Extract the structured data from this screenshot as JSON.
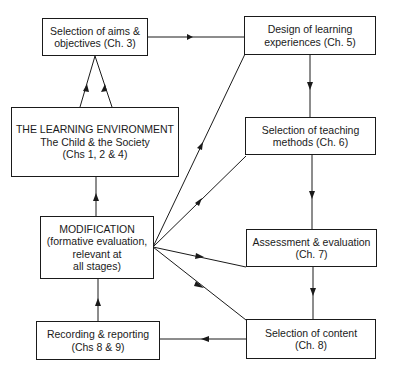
{
  "diagram": {
    "nodes": {
      "aims": {
        "lines": [
          "Selection of aims &",
          "objectives (Ch. 3)"
        ]
      },
      "environment": {
        "lines": [
          "THE LEARNING ENVIRONMENT",
          "The Child & the Society",
          "(Chs 1, 2 & 4)"
        ]
      },
      "modification": {
        "lines": [
          "MODIFICATION",
          "(formative evaluation,",
          "relevant at",
          "all stages)"
        ]
      },
      "recording": {
        "lines": [
          "Recording & reporting",
          "(Chs 8 & 9)"
        ]
      },
      "design": {
        "lines": [
          "Design of learning",
          "experiences (Ch. 5)"
        ]
      },
      "methods": {
        "lines": [
          "Selection of teaching",
          "methods (Ch. 6)"
        ]
      },
      "assessment": {
        "lines": [
          "Assessment & evaluation",
          "(Ch. 7)"
        ]
      },
      "content": {
        "lines": [
          "Selection of content",
          "(Ch. 8)"
        ]
      }
    },
    "edges": [
      {
        "from": "aims",
        "to": "design"
      },
      {
        "from": "design",
        "to": "methods"
      },
      {
        "from": "methods",
        "to": "assessment"
      },
      {
        "from": "assessment",
        "to": "content"
      },
      {
        "from": "content",
        "to": "recording"
      },
      {
        "from": "recording",
        "to": "modification"
      },
      {
        "from": "modification",
        "to": "environment"
      },
      {
        "from": "environment",
        "to": "aims",
        "note": "two lines"
      },
      {
        "from": "design",
        "to": "modification"
      },
      {
        "from": "methods",
        "to": "modification"
      },
      {
        "from": "assessment",
        "to": "modification"
      },
      {
        "from": "content",
        "to": "modification"
      }
    ],
    "line_color": "#1a1a1a"
  }
}
